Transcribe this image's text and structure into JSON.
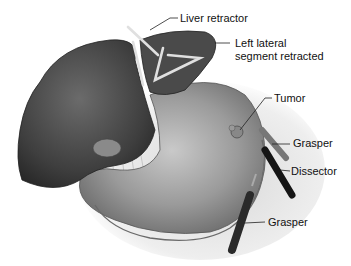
{
  "figure": {
    "type": "anatomical illustration",
    "labels": [
      {
        "id": "liver-retractor",
        "text": "Liver retractor"
      },
      {
        "id": "left-lateral-segment",
        "text": "Left lateral\nsegment retracted",
        "line1": "Left lateral",
        "line2": "segment retracted"
      },
      {
        "id": "tumor",
        "text": "Tumor"
      },
      {
        "id": "grasper-top",
        "text": "Grasper"
      },
      {
        "id": "dissector",
        "text": "Dissector"
      },
      {
        "id": "grasper-bottom",
        "text": "Grasper"
      }
    ]
  }
}
